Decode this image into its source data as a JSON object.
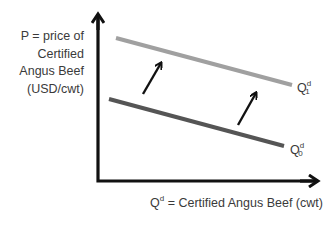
{
  "diagram": {
    "type": "demand-shift",
    "y_axis": {
      "label_lines": [
        "P = price of",
        "Certified",
        "Angus Beef",
        "(USD/cwt)"
      ]
    },
    "x_axis": {
      "label_prefix": "Q",
      "label_sup": "d",
      "label_rest": " = Certified Angus Beef (cwt)"
    },
    "curves": [
      {
        "name": "Q^d_1",
        "base": "Q",
        "sup": "d",
        "sub": "1",
        "color": "#a0a0a0",
        "x1": 116,
        "y1": 38,
        "x2": 292,
        "y2": 85
      },
      {
        "name": "Q^d_0",
        "base": "Q",
        "sup": "d",
        "sub": "0",
        "color": "#555555",
        "x1": 109,
        "y1": 99,
        "x2": 284,
        "y2": 146
      }
    ],
    "shift_arrows": [
      {
        "x1": 143,
        "y1": 94,
        "x2": 161,
        "y2": 63
      },
      {
        "x1": 238,
        "y1": 125,
        "x2": 256,
        "y2": 93
      }
    ],
    "colors": {
      "axis": "#111111",
      "text": "#3a3a3a"
    }
  }
}
